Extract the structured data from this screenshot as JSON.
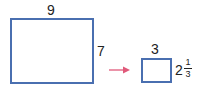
{
  "diagram": {
    "large_rect": {
      "width_label": "9",
      "height_label": "7"
    },
    "small_rect": {
      "width_label": "3",
      "height_whole": "2",
      "height_num": "1",
      "height_den": "3"
    },
    "colors": {
      "rect_stroke": "#4a6fb0",
      "arrow": "#e05a7a"
    }
  }
}
